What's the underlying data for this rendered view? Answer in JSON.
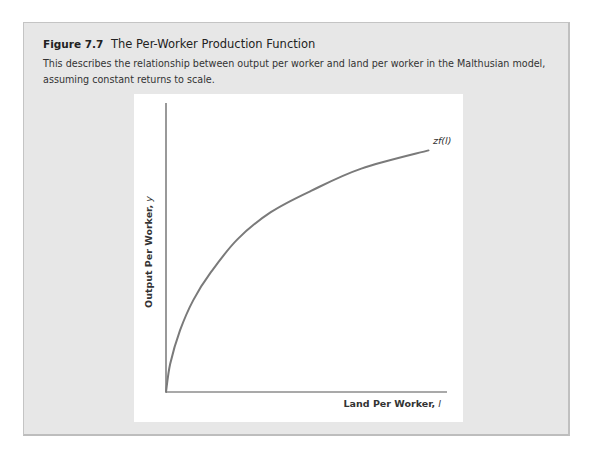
{
  "figure": {
    "number": "Figure 7.7",
    "title": "The Per-Worker Production Function",
    "caption": "This describes the relationship between output per worker and land per worker in the Malthusian model, assuming constant returns to scale."
  },
  "colors": {
    "box_background": "#e7e7e7",
    "box_border": "#c4c4c4",
    "panel_background": "#ffffff",
    "axis": "#555555",
    "curve": "#7a7a7a"
  },
  "chart_data": {
    "type": "line",
    "title": "The Per-Worker Production Function",
    "xlabel": "Land Per Worker, l",
    "ylabel": "Output Per Worker, y",
    "xlabel_main": "Land Per Worker, ",
    "xlabel_var": "l",
    "ylabel_main": "Output Per Worker, ",
    "ylabel_var": "y",
    "grid": false,
    "ticks": "none",
    "legend": "none",
    "series": [
      {
        "name": "zf(l)",
        "label_main": "zf(",
        "label_var": "l",
        "label_close": ")",
        "description": "concave, increasing; passes through origin",
        "points_normalized": [
          [
            0.0,
            0.0
          ],
          [
            0.015,
            0.098
          ],
          [
            0.05,
            0.213
          ],
          [
            0.097,
            0.318
          ],
          [
            0.158,
            0.412
          ],
          [
            0.254,
            0.528
          ],
          [
            0.373,
            0.622
          ],
          [
            0.516,
            0.696
          ],
          [
            0.695,
            0.773
          ],
          [
            0.934,
            0.836
          ]
        ]
      }
    ],
    "xlim": [
      0,
      1
    ],
    "ylim": [
      0,
      1
    ]
  }
}
